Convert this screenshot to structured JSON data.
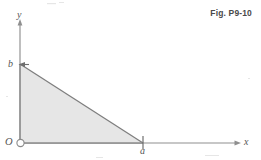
{
  "figure": {
    "caption": "Fig. P9-10",
    "axes": {
      "x_label": "x",
      "y_label": "y",
      "origin_label": "O"
    },
    "vertices": {
      "a_label": "a",
      "b_label": "b"
    },
    "colors": {
      "line": "#8a8a8a",
      "fill": "#e6e6e6",
      "text": "#555555",
      "caption": "#4a4a4a",
      "background": "#ffffff"
    },
    "geometry": {
      "origin_px": [
        20,
        143
      ],
      "vertex_a_px": [
        143,
        143
      ],
      "vertex_b_px": [
        20,
        64
      ],
      "x_axis_end_px": [
        240,
        143
      ],
      "y_axis_end_px": [
        20,
        22
      ]
    },
    "markers": {
      "origin_pin": "open-circle",
      "vertex_a_tick": "vertical-tick",
      "vertex_b_arrow": "left-arrowhead"
    }
  }
}
